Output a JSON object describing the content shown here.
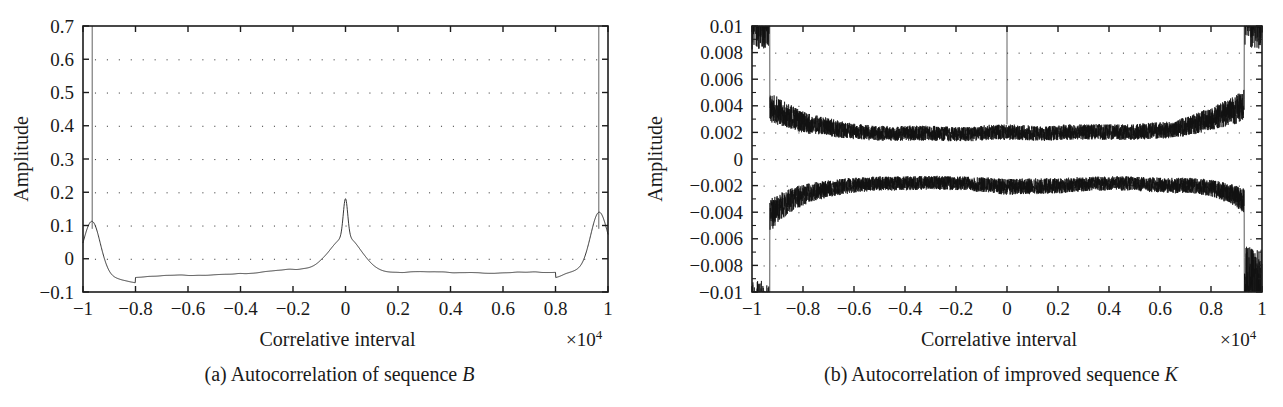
{
  "figure": {
    "panels": [
      {
        "id": "panel-a",
        "caption_prefix": "(a)",
        "caption_text": "Autocorrelation of sequence",
        "caption_symbol": "B"
      },
      {
        "id": "panel-b",
        "caption_prefix": "(b)",
        "caption_text": "Autocorrelation of improved sequence",
        "caption_symbol": "K"
      }
    ]
  },
  "chart_data": [
    {
      "type": "line",
      "title": "",
      "panel_label": "(a) Autocorrelation of sequence B",
      "xlabel": "Correlative interval",
      "ylabel": "Amplitude",
      "x_multiplier": "×10",
      "x_multiplier_exponent": "4",
      "xlim": [
        -1,
        1
      ],
      "ylim": [
        -0.1,
        0.7
      ],
      "xticks": [
        -1,
        -0.8,
        -0.6,
        -0.4,
        -0.2,
        0,
        0.2,
        0.4,
        0.6,
        0.8,
        1
      ],
      "xticklabels": [
        "−1",
        "−0.8",
        "−0.6",
        "−0.4",
        "−0.2",
        "0",
        "0.2",
        "0.4",
        "0.6",
        "0.8",
        "1"
      ],
      "yticks": [
        0.7,
        0.6,
        0.5,
        0.4,
        0.3,
        0.2,
        0.1,
        0,
        -0.1
      ],
      "yticklabels": [
        "0.7",
        "0.6",
        "0.5",
        "0.4",
        "0.3",
        "0.2",
        "0.1",
        "0",
        "−0.1"
      ],
      "grid": "dotted",
      "legend": "none",
      "series_name": "autocorrelation of sequence B",
      "line_color": "#141414",
      "noise_seed": 20114,
      "noise_amplitude": 0.012,
      "baseline_envelope": -0.04,
      "center_peak_value": 0.22,
      "center_peak_shoulder": 0.105,
      "edge_peak_value": 0.68,
      "edge_peak_positions": [
        -0.965,
        0.965
      ],
      "sample_count": 1600,
      "annotations": [
        {
          "x": 0,
          "y": 0.22,
          "note": "central autocorrelation peak"
        },
        {
          "x": -0.965,
          "y": 0.68,
          "note": "left edge spike (off top of axis)"
        },
        {
          "x": 0.965,
          "y": 0.68,
          "note": "right edge spike (off top of axis)"
        }
      ]
    },
    {
      "type": "line",
      "title": "",
      "panel_label": "(b) Autocorrelation of improved sequence K",
      "xlabel": "Correlative interval",
      "ylabel": "Amplitude",
      "x_multiplier": "×10",
      "x_multiplier_exponent": "4",
      "xlim": [
        -1,
        1
      ],
      "ylim": [
        -0.01,
        0.01
      ],
      "xticks": [
        -1,
        -0.8,
        -0.6,
        -0.4,
        -0.2,
        0,
        0.2,
        0.4,
        0.6,
        0.8,
        1
      ],
      "xticklabels": [
        "−1",
        "−0.8",
        "−0.6",
        "−0.4",
        "−0.2",
        "0",
        "0.2",
        "0.4",
        "0.6",
        "0.8",
        "1"
      ],
      "yticks": [
        0.01,
        0.008,
        0.006,
        0.004,
        0.002,
        0,
        -0.002,
        -0.004,
        -0.006,
        -0.008,
        -0.01
      ],
      "yticklabels": [
        "0.01",
        "0.008",
        "0.006",
        "0.004",
        "0.002",
        "0",
        "−0.002",
        "−0.004",
        "−0.006",
        "−0.008",
        "−0.01"
      ],
      "grid": "dotted",
      "legend": "none",
      "series_name": "autocorrelation of improved sequence K",
      "line_color": "#111111",
      "noise_seed": 77341,
      "noise_amplitude_center": 0.0024,
      "noise_amplitude_edge": 0.0062,
      "center_peak_value": 0.01,
      "edge_saturation_positions": [
        -0.95,
        0.95
      ],
      "sample_count": 5200,
      "annotations": [
        {
          "x": 0,
          "y": 0.01,
          "note": "central peak clipped at top of axis"
        },
        {
          "x": -0.95,
          "y": 0.01,
          "note": "left edge saturated noise band"
        },
        {
          "x": 0.95,
          "y": 0.01,
          "note": "right edge saturated noise band"
        }
      ]
    }
  ]
}
